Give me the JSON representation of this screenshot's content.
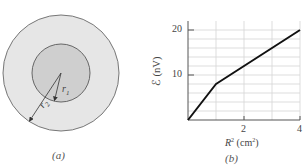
{
  "panel_a": {
    "caption": "(a)",
    "outer_circle": {
      "cx": 61,
      "cy": 73,
      "r": 58,
      "fill": "#e6e6e6",
      "stroke": "#777777"
    },
    "inner_circle": {
      "cx": 61,
      "cy": 73,
      "r": 29,
      "fill": "#cfcfcf",
      "stroke": "#666666"
    },
    "labels": {
      "r1": "r",
      "r1_sub": "1",
      "r2": "r",
      "r2_sub": "2"
    }
  },
  "panel_b": {
    "caption": "(b)",
    "ylabel": "ℰ (nV)",
    "xlabel_base": "R",
    "xlabel_sup": "2",
    "xlabel_unit_open": " (cm",
    "xlabel_unit_sup": "2",
    "xlabel_unit_close": ")",
    "yticks": [
      "10",
      "20"
    ],
    "xticks": [
      "2",
      "4"
    ]
  },
  "chart_data": {
    "type": "line",
    "title": "",
    "xlabel": "R² (cm²)",
    "ylabel": "ℰ (nV)",
    "xlim": [
      0,
      4
    ],
    "ylim": [
      0,
      22
    ],
    "xticks": [
      2,
      4
    ],
    "yticks": [
      10,
      20
    ],
    "grid": true,
    "grid_x": [
      1,
      2,
      3
    ],
    "grid_y": [
      2,
      4,
      6,
      8,
      10,
      12,
      14,
      16,
      18,
      20
    ],
    "series": [
      {
        "name": "emf",
        "x": [
          0,
          1,
          4
        ],
        "y": [
          0,
          8,
          20
        ]
      }
    ]
  }
}
